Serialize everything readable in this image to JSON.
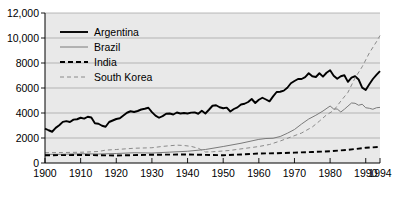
{
  "chart_data": {
    "type": "line",
    "title": "",
    "subtitle": "",
    "xlabel": "",
    "ylabel": "",
    "xlim": [
      1900,
      1994
    ],
    "ylim": [
      0,
      12000
    ],
    "grid": true,
    "grid_axis": "y",
    "legend_position": "top-left",
    "plot_background": "#e9e9e9",
    "xticks": [
      1900,
      1910,
      1920,
      1930,
      1940,
      1950,
      1960,
      1970,
      1980,
      1990,
      1994
    ],
    "xticklabels": [
      "1900",
      "1910",
      "1920",
      "1930",
      "1940",
      "1950",
      "1960",
      "1970",
      "1980",
      "1990",
      "1994"
    ],
    "yticks": [
      0,
      2000,
      4000,
      6000,
      8000,
      10000,
      12000
    ],
    "yticklabels": [
      "0",
      "2000",
      "4000",
      "6000",
      "8000",
      "10,000",
      "12,000"
    ],
    "series": [
      {
        "name": "Argentina",
        "color": "#000000",
        "style": "solid",
        "width": 1.9,
        "x": [
          1900,
          1901,
          1902,
          1903,
          1904,
          1905,
          1906,
          1907,
          1908,
          1909,
          1910,
          1911,
          1912,
          1913,
          1914,
          1915,
          1916,
          1917,
          1918,
          1919,
          1920,
          1921,
          1922,
          1923,
          1924,
          1925,
          1926,
          1927,
          1928,
          1929,
          1930,
          1931,
          1932,
          1933,
          1934,
          1935,
          1936,
          1937,
          1938,
          1939,
          1940,
          1941,
          1942,
          1943,
          1944,
          1945,
          1946,
          1947,
          1948,
          1949,
          1950,
          1951,
          1952,
          1953,
          1954,
          1955,
          1956,
          1957,
          1958,
          1959,
          1960,
          1961,
          1962,
          1963,
          1964,
          1965,
          1966,
          1967,
          1968,
          1969,
          1970,
          1971,
          1972,
          1973,
          1974,
          1975,
          1976,
          1977,
          1978,
          1979,
          1980,
          1981,
          1982,
          1983,
          1984,
          1985,
          1986,
          1987,
          1988,
          1989,
          1990,
          1991,
          1992,
          1993,
          1994
        ],
        "values": [
          2756,
          2620,
          2500,
          2810,
          3020,
          3290,
          3350,
          3280,
          3470,
          3500,
          3620,
          3550,
          3700,
          3640,
          3180,
          3140,
          2980,
          2900,
          3280,
          3400,
          3520,
          3580,
          3800,
          4020,
          4140,
          4080,
          4160,
          4280,
          4340,
          4420,
          4070,
          3790,
          3620,
          3750,
          3940,
          3960,
          3880,
          4040,
          3960,
          4000,
          3960,
          4030,
          4050,
          3940,
          4180,
          3960,
          4260,
          4580,
          4620,
          4460,
          4380,
          4430,
          4120,
          4320,
          4450,
          4680,
          4740,
          4880,
          5120,
          4800,
          5060,
          5220,
          5080,
          4930,
          5330,
          5680,
          5700,
          5790,
          6020,
          6380,
          6560,
          6720,
          6720,
          6870,
          7180,
          6940,
          6880,
          7180,
          6910,
          7220,
          7420,
          6980,
          6740,
          6940,
          7020,
          6490,
          6830,
          6940,
          6680,
          6030,
          5840,
          6300,
          6720,
          7050,
          7350
        ]
      },
      {
        "name": "Brazil",
        "color": "#7a7a7a",
        "style": "solid",
        "width": 1.0,
        "x": [
          1900,
          1905,
          1910,
          1915,
          1920,
          1925,
          1930,
          1935,
          1940,
          1945,
          1950,
          1955,
          1960,
          1962,
          1964,
          1966,
          1968,
          1970,
          1972,
          1974,
          1976,
          1978,
          1980,
          1981,
          1982,
          1983,
          1984,
          1985,
          1986,
          1987,
          1988,
          1989,
          1990,
          1991,
          1992,
          1993,
          1994
        ],
        "values": [
          690,
          700,
          740,
          720,
          760,
          820,
          800,
          870,
          940,
          1080,
          1320,
          1580,
          1890,
          1960,
          1980,
          2120,
          2380,
          2680,
          3120,
          3520,
          3820,
          4160,
          4560,
          4320,
          4320,
          4080,
          4300,
          4550,
          4800,
          4780,
          4620,
          4700,
          4420,
          4380,
          4300,
          4420,
          4450
        ]
      },
      {
        "name": "India",
        "color": "#000000",
        "style": "dashed",
        "width": 1.9,
        "x": [
          1900,
          1910,
          1920,
          1930,
          1940,
          1950,
          1955,
          1960,
          1965,
          1970,
          1975,
          1980,
          1985,
          1990,
          1994
        ],
        "values": [
          620,
          640,
          600,
          660,
          680,
          620,
          680,
          760,
          780,
          830,
          880,
          940,
          1050,
          1220,
          1290
        ]
      },
      {
        "name": "South Korea",
        "color": "#8a8a8a",
        "style": "dashed",
        "width": 1.0,
        "x": [
          1900,
          1905,
          1910,
          1912,
          1915,
          1917,
          1920,
          1925,
          1930,
          1933,
          1935,
          1937,
          1939,
          1941,
          1943,
          1945,
          1947,
          1950,
          1952,
          1955,
          1958,
          1960,
          1963,
          1966,
          1969,
          1972,
          1975,
          1977,
          1979,
          1981,
          1983,
          1985,
          1987,
          1989,
          1991,
          1993,
          1994
        ],
        "values": [
          820,
          840,
          860,
          880,
          920,
          1030,
          1080,
          1180,
          1220,
          1330,
          1380,
          1430,
          1400,
          1330,
          1180,
          880,
          900,
          960,
          1010,
          1130,
          1240,
          1320,
          1480,
          1760,
          2080,
          2400,
          2880,
          3350,
          3850,
          4200,
          4950,
          5650,
          6800,
          7700,
          8800,
          9700,
          10200
        ]
      }
    ],
    "legend": [
      {
        "label": "Argentina",
        "color": "#000000",
        "style": "solid",
        "width": 1.9
      },
      {
        "label": "Brazil",
        "color": "#7a7a7a",
        "style": "solid",
        "width": 1.0
      },
      {
        "label": "India",
        "color": "#000000",
        "style": "dashed",
        "width": 1.9
      },
      {
        "label": "South Korea",
        "color": "#8a8a8a",
        "style": "dashed",
        "width": 1.0
      }
    ]
  }
}
